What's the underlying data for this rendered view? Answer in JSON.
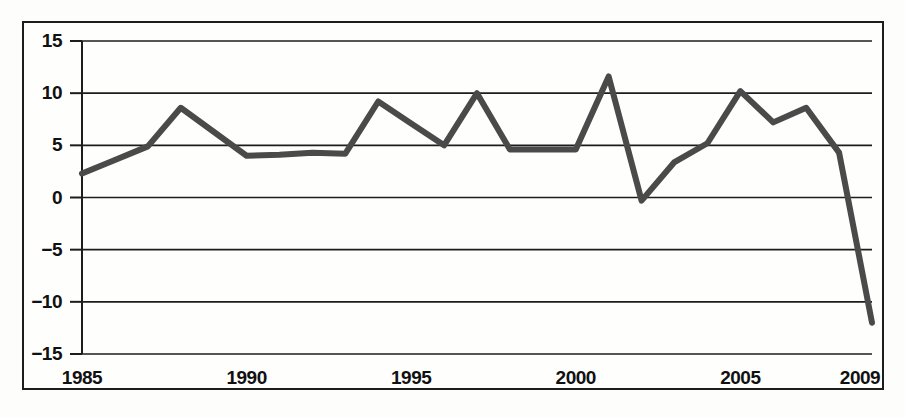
{
  "figure": {
    "background_color": "#fdfdfb",
    "frame_color": "#1d1d1d",
    "series_color": "#4a4a4a",
    "grid_color": "#1d1d1d"
  },
  "axes": {
    "y_ticks": [
      "15",
      "10",
      "5",
      "0",
      "−5",
      "−10",
      "−15"
    ],
    "x_ticks": [
      "1985",
      "1990",
      "1995",
      "2000",
      "2005",
      "2009"
    ]
  },
  "chart_data": {
    "type": "line",
    "title": "",
    "xlabel": "",
    "ylabel": "",
    "xlim": [
      1985,
      2009
    ],
    "ylim": [
      -15,
      15
    ],
    "grid": true,
    "legend": "none",
    "x_tick_values": [
      1985,
      1990,
      1995,
      2000,
      2005,
      2009
    ],
    "y_tick_values": [
      15,
      10,
      5,
      0,
      -5,
      -10,
      -15
    ],
    "x": [
      1985,
      1986,
      1987,
      1988,
      1989,
      1990,
      1991,
      1992,
      1993,
      1994,
      1995,
      1996,
      1997,
      1998,
      1999,
      2000,
      2001,
      2002,
      2003,
      2004,
      2005,
      2006,
      2007,
      2008,
      2009
    ],
    "values": [
      2.3,
      3.6,
      4.9,
      8.6,
      6.3,
      4.0,
      4.1,
      4.3,
      4.2,
      9.2,
      7.1,
      5.0,
      10.0,
      4.6,
      4.6,
      4.6,
      11.6,
      -0.3,
      3.4,
      5.2,
      10.2,
      7.2,
      8.6,
      4.3,
      -12.0
    ],
    "series": [
      {
        "name": "series-1",
        "values": [
          2.3,
          3.6,
          4.9,
          8.6,
          6.3,
          4.0,
          4.1,
          4.3,
          4.2,
          9.2,
          7.1,
          5.0,
          10.0,
          4.6,
          4.6,
          4.6,
          11.6,
          -0.3,
          3.4,
          5.2,
          10.2,
          7.2,
          8.6,
          4.3,
          -12.0
        ]
      }
    ]
  }
}
